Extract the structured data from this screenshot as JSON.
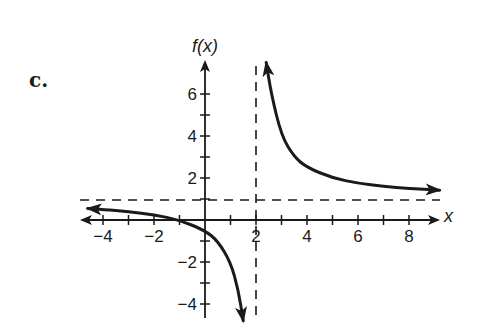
{
  "problem_label": "c.",
  "chart_data": {
    "type": "line",
    "title": "",
    "xlabel": "x",
    "ylabel": "f(x)",
    "xlim": [
      -4.9,
      9.2
    ],
    "ylim": [
      -4.8,
      7.5
    ],
    "x_ticks": [
      -4,
      -3,
      -2,
      -1,
      1,
      2,
      3,
      4,
      5,
      6,
      7,
      8
    ],
    "x_tick_labels": [
      {
        "value": -4,
        "text": "−4"
      },
      {
        "value": -2,
        "text": "−2"
      },
      {
        "value": 2,
        "text": "2"
      },
      {
        "value": 4,
        "text": "4"
      },
      {
        "value": 6,
        "text": "6"
      },
      {
        "value": 8,
        "text": "8"
      }
    ],
    "y_ticks": [
      -4,
      -3,
      -2,
      -1,
      1,
      2,
      3,
      4,
      5,
      6
    ],
    "y_tick_labels": [
      {
        "value": 6,
        "text": "6"
      },
      {
        "value": 4,
        "text": "4"
      },
      {
        "value": 2,
        "text": "2"
      },
      {
        "value": -2,
        "text": "−2"
      },
      {
        "value": -4,
        "text": "−4"
      }
    ],
    "grid": false,
    "asymptotes": {
      "vertical": {
        "x": 2,
        "style": "dashed"
      },
      "horizontal": {
        "y": 1,
        "style": "dashed"
      }
    },
    "series": [
      {
        "name": "left branch",
        "function": "1 + 3/(x - 2)",
        "x": [
          -4.6,
          -4,
          -3,
          -2,
          -1,
          0,
          0.5,
          1,
          1.3,
          1.5
        ],
        "y": [
          0.55,
          0.5,
          0.4,
          0.25,
          0.0,
          -0.5,
          -1.0,
          -2.0,
          -3.3,
          -4.8
        ],
        "arrow_ends": true
      },
      {
        "name": "right branch",
        "function": "1 + 3/(x - 2)",
        "x": [
          2.4,
          2.6,
          3,
          3.5,
          4,
          5,
          6,
          7,
          8,
          9.2
        ],
        "y": [
          7.5,
          6.0,
          4.0,
          3.0,
          2.5,
          2.0,
          1.75,
          1.6,
          1.5,
          1.42
        ],
        "arrow_ends": true
      }
    ],
    "annotations": []
  }
}
